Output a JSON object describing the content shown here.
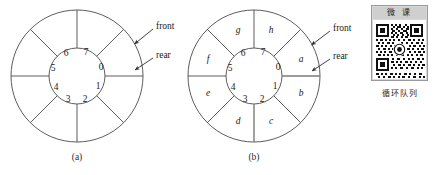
{
  "figure": {
    "caption_a": "(a)",
    "caption_b": "(b)",
    "diagram_a": {
      "inner_labels": [
        "0",
        "1",
        "2",
        "3",
        "4",
        "5",
        "6",
        "7"
      ],
      "outer_labels": [],
      "annotations": [
        {
          "name": "front",
          "text": "front"
        },
        {
          "name": "rear",
          "text": "rear"
        }
      ]
    },
    "diagram_b": {
      "inner_labels": [
        "0",
        "1",
        "2",
        "3",
        "4",
        "5",
        "6",
        "7"
      ],
      "outer_labels": [
        "a",
        "b",
        "c",
        "d",
        "e",
        "f",
        "g",
        "h"
      ],
      "annotations": [
        {
          "name": "front",
          "text": "front"
        },
        {
          "name": "rear",
          "text": "rear"
        }
      ]
    },
    "colors": {
      "stroke": "#4a4a4a",
      "highlight_stroke": "#7a7a7a",
      "text": "#1a1a1a",
      "background": "#ffffff"
    }
  },
  "qr": {
    "header": "微 课",
    "caption": "循环队列",
    "border_color": "#9a9a9a",
    "header_bg": "#cfcfcf",
    "panel_bg": "#d9d9d9"
  }
}
